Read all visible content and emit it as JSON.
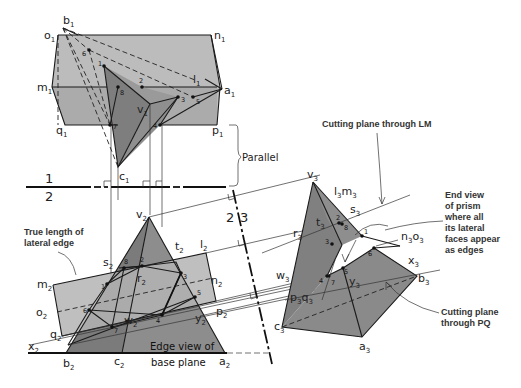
{
  "diagram": {
    "colors": {
      "prism_light": "#b8b8b8",
      "prism_face": "#a6a6a6",
      "pyramid_dark": "#7a7a7a",
      "pyramid_mid": "#8c8c8c",
      "line": "#1a1a1a",
      "background": "#ffffff"
    },
    "fold_lines": {
      "fl12_top": "1",
      "fl12_bottom": "2",
      "fl23_left": "2",
      "fl23_right": "3"
    },
    "view1": {
      "vertices": {
        "b": "b",
        "o": "o",
        "n": "n",
        "m": "m",
        "l": "l",
        "a": "a",
        "q": "q",
        "p": "p",
        "v": "v",
        "c": "c"
      },
      "subscript": "1",
      "points": [
        "1",
        "2",
        "3",
        "4",
        "5",
        "6",
        "7",
        "8"
      ]
    },
    "view2": {
      "vertices": {
        "v": "v",
        "s": "s",
        "t": "t",
        "l": "l",
        "m": "m",
        "n": "n",
        "r": "r",
        "o": "o",
        "p": "p",
        "q": "q",
        "w": "w",
        "y": "y",
        "x": "x",
        "b": "b",
        "c": "c",
        "a": "a"
      },
      "subscript": "2",
      "points": [
        "1",
        "2",
        "3",
        "4",
        "5",
        "6",
        "7",
        "8"
      ]
    },
    "view3": {
      "vertices": {
        "v": "v",
        "lm": "l",
        "lm2": "m",
        "s": "s",
        "t": "t",
        "r": "r",
        "no": "n",
        "no2": "o",
        "w": "w",
        "x": "x",
        "b": "b",
        "y": "y",
        "pq": "p",
        "pq2": "q",
        "c": "c",
        "a": "a"
      },
      "subscript": "3",
      "points": [
        "1",
        "2",
        "3",
        "4",
        "5",
        "6",
        "7",
        "8"
      ]
    },
    "annotations": {
      "parallel": "Parallel",
      "true_length_line1": "True length of",
      "true_length_line2": "lateral edge",
      "edge_view_line1": "Edge view of",
      "edge_view_line2": "base plane",
      "cutting_lm": "Cutting plane through LM",
      "end_view_line1": "End view",
      "end_view_line2": "of prism",
      "end_view_line3": "where all",
      "end_view_line4": "its lateral",
      "end_view_line5": "faces appear",
      "end_view_line6": "as edges",
      "cutting_pq_line1": "Cutting plane",
      "cutting_pq_line2": "through PQ"
    }
  }
}
